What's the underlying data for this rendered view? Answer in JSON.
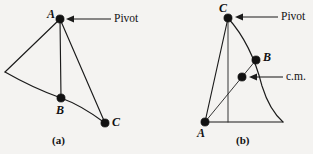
{
  "figure": {
    "background_color": "#f4f3f1",
    "ink_color": "#111111",
    "panels": [
      {
        "id": "a",
        "caption": "(a)",
        "caption_x": 62,
        "caption_y": 137,
        "description": "Irregular lamina pivoted at point A; points A, B, C marked along a vertical/curved boundary",
        "points": [
          {
            "name": "A",
            "label": "A",
            "x": 60,
            "y": 19,
            "label_x": 47,
            "label_y": 8,
            "role": "pivot"
          },
          {
            "name": "B",
            "label": "B",
            "x": 61,
            "y": 98,
            "label_x": 56,
            "label_y": 104,
            "role": "marked-point"
          },
          {
            "name": "C",
            "label": "C",
            "x": 105,
            "y": 123,
            "label_x": 112,
            "label_y": 116,
            "role": "marked-point"
          },
          {
            "name": "left-vertex",
            "label": "",
            "x": 5,
            "y": 72,
            "label_x": 0,
            "label_y": 0,
            "role": "vertex"
          }
        ],
        "annotation": {
          "text": "Pivot",
          "text_x": 114,
          "text_y": 13,
          "arrow_from_x": 111,
          "arrow_from_y": 19,
          "arrow_to_x": 67,
          "arrow_to_y": 19
        }
      },
      {
        "id": "b",
        "caption": "(b)",
        "caption_x": 245,
        "caption_y": 137,
        "description": "Same lamina re-oriented, pivoted at point C; center of mass marked on vertical line from pivot",
        "points": [
          {
            "name": "C",
            "label": "C",
            "x": 228,
            "y": 18,
            "label_x": 219,
            "label_y": 3,
            "role": "pivot"
          },
          {
            "name": "B",
            "label": "B",
            "x": 256,
            "y": 60,
            "label_x": 263,
            "label_y": 53,
            "role": "marked-point"
          },
          {
            "name": "cm",
            "label": "",
            "x": 242,
            "y": 77,
            "label_x": 0,
            "label_y": 0,
            "role": "center-of-mass"
          },
          {
            "name": "A",
            "label": "A",
            "x": 205,
            "y": 122,
            "label_x": 197,
            "label_y": 128,
            "role": "marked-point"
          },
          {
            "name": "right-vertex",
            "label": "",
            "x": 283,
            "y": 122,
            "label_x": 0,
            "label_y": 0,
            "role": "vertex"
          }
        ],
        "annotations": [
          {
            "name": "pivot",
            "text": "Pivot",
            "text_x": 281,
            "text_y": 11,
            "arrow_from_x": 278,
            "arrow_from_y": 17,
            "arrow_to_x": 235,
            "arrow_to_y": 17
          },
          {
            "name": "center-of-mass",
            "text": "c.m.",
            "text_x": 286,
            "text_y": 71,
            "arrow_from_x": 283,
            "arrow_from_y": 77,
            "arrow_to_x": 249,
            "arrow_to_y": 77
          }
        ]
      }
    ]
  }
}
